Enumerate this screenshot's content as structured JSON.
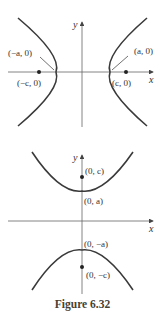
{
  "figure": {
    "caption": "Figure 6.32",
    "top_panel": {
      "description": "Hyperbola opening left/right (transverse axis along x)",
      "axes": {
        "x_label": "x",
        "y_label": "y"
      },
      "labels": {
        "left_vertex": "(−a, 0)",
        "right_vertex": "(a, 0)",
        "left_focus": "(−c, 0)",
        "right_focus": "(c, 0)"
      }
    },
    "bottom_panel": {
      "description": "Hyperbola opening up/down (transverse axis along y)",
      "axes": {
        "x_label": "x",
        "y_label": "y"
      },
      "labels": {
        "top_focus": "(0, c)",
        "top_vertex": "(0, a)",
        "bottom_vertex": "(0, −a)",
        "bottom_focus": "(0, −c)"
      }
    },
    "colors": {
      "curve": "#3a3a3a",
      "axis": "#555555",
      "text": "#333333"
    }
  }
}
